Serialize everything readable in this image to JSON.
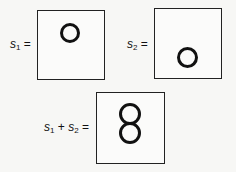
{
  "panels": [
    {
      "id": "s1",
      "var": "s",
      "sub": "1",
      "eq": " =",
      "rings": [
        {
          "x": 20,
          "y": 12,
          "d": 20
        }
      ]
    },
    {
      "id": "s2",
      "var": "s",
      "sub": "2",
      "eq": " =",
      "rings": [
        {
          "x": 22,
          "y": 39,
          "d": 20
        }
      ]
    },
    {
      "id": "sum",
      "label": "s1 + s2 =",
      "rings": [
        {
          "x": 22,
          "y": 10,
          "d": 22
        },
        {
          "x": 22,
          "y": 28,
          "d": 22
        }
      ]
    }
  ],
  "labels": {
    "s1_var": "s",
    "s1_sub": "1",
    "s1_eq": " =",
    "s2_var": "s",
    "s2_sub": "2",
    "s2_eq": " =",
    "sum_var1": "s",
    "sum_sub1": "1",
    "sum_plus": " + ",
    "sum_var2": "s",
    "sum_sub2": "2",
    "sum_eq": " ="
  }
}
